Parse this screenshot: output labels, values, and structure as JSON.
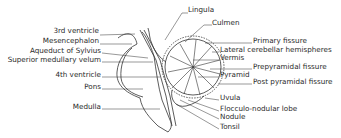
{
  "diagram": {
    "left_labels": [
      {
        "text": "3rd ventricle",
        "x": 98,
        "y": 31
      },
      {
        "text": "Mesencephalon",
        "x": 98,
        "y": 41
      },
      {
        "text": "Aqueduct of Sylvius",
        "x": 100,
        "y": 51
      },
      {
        "text": "Superior medullary velum",
        "x": 100,
        "y": 60
      },
      {
        "text": "4th ventricle",
        "x": 100,
        "y": 74
      },
      {
        "text": "Pons",
        "x": 100,
        "y": 86
      },
      {
        "text": "Medulla",
        "x": 100,
        "y": 106
      }
    ],
    "right_labels": [
      {
        "text": "Lingula",
        "x": 188,
        "y": 10
      },
      {
        "text": "Culmen",
        "x": 212,
        "y": 22
      },
      {
        "text": "Primary fissure",
        "x": 253,
        "y": 40
      },
      {
        "text": "Lateral cerebellar hemispheres",
        "x": 220,
        "y": 49
      },
      {
        "text": "Vermis",
        "x": 220,
        "y": 57
      },
      {
        "text": "Prepyramidal fissure",
        "x": 253,
        "y": 66
      },
      {
        "text": "Pyramid",
        "x": 220,
        "y": 74
      },
      {
        "text": "Post pyramidal fissure",
        "x": 253,
        "y": 81
      },
      {
        "text": "Uvula",
        "x": 220,
        "y": 97
      },
      {
        "text": "Flocculo-nodular lobe",
        "x": 220,
        "y": 108
      },
      {
        "text": "Nodule",
        "x": 220,
        "y": 116
      },
      {
        "text": "Tonsil",
        "x": 220,
        "y": 126
      }
    ],
    "line_color": "#333333",
    "text_color": "#2a2a2a"
  }
}
